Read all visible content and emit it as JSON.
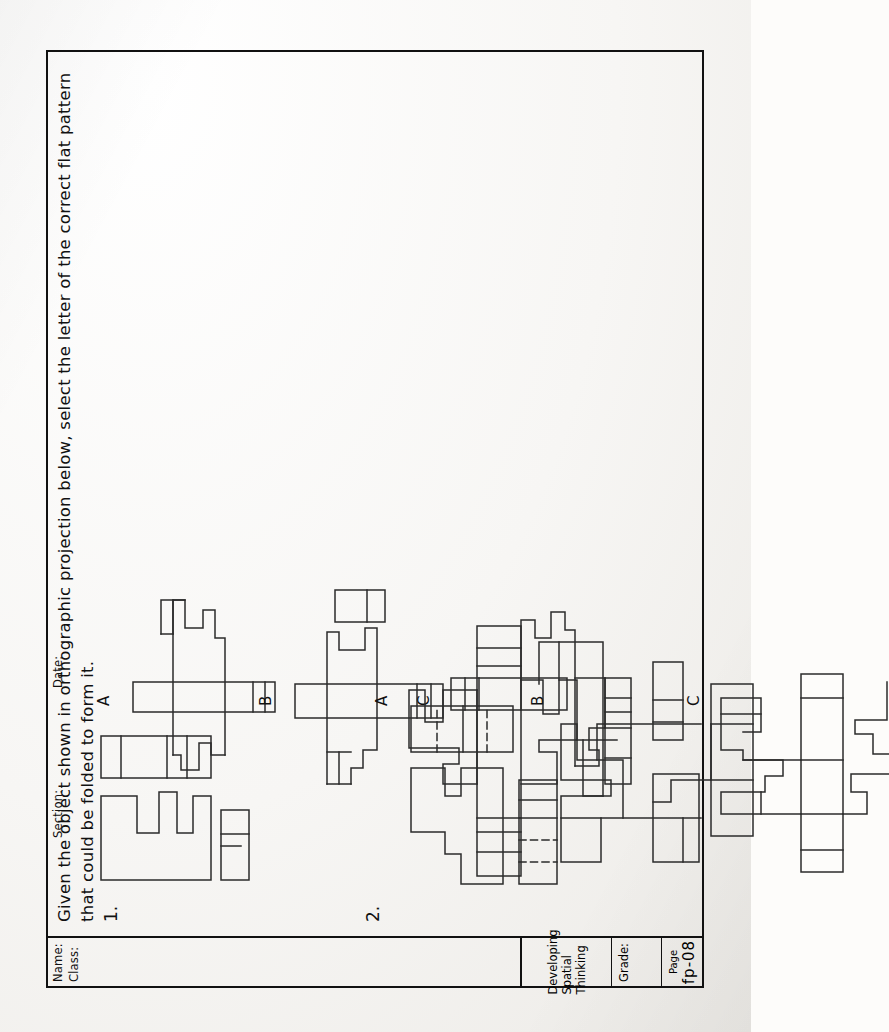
{
  "document": {
    "kind": "worksheet",
    "orientation": "landscape-rotated",
    "instruction": "Given the object shown in orthographic projection below, select the letter of the correct flat pattern that could be folded to form it."
  },
  "title_block": {
    "name_label": "Name:",
    "class_label": "Class:",
    "section_label": "Section:",
    "date_label": "Date:",
    "worksheet_title": "Developing Spatial Thinking",
    "grade_label": "Grade:",
    "grade_value": "",
    "page_label": "Page",
    "page_number": "fp-08"
  },
  "problems": [
    {
      "number": "1.",
      "options": [
        "A",
        "B",
        "C"
      ]
    },
    {
      "number": "2.",
      "options": [
        "A",
        "B",
        "C"
      ]
    }
  ],
  "colors": {
    "ink": "#2b2b2b",
    "frame": "#111111",
    "paper": "#fdfcfa"
  }
}
